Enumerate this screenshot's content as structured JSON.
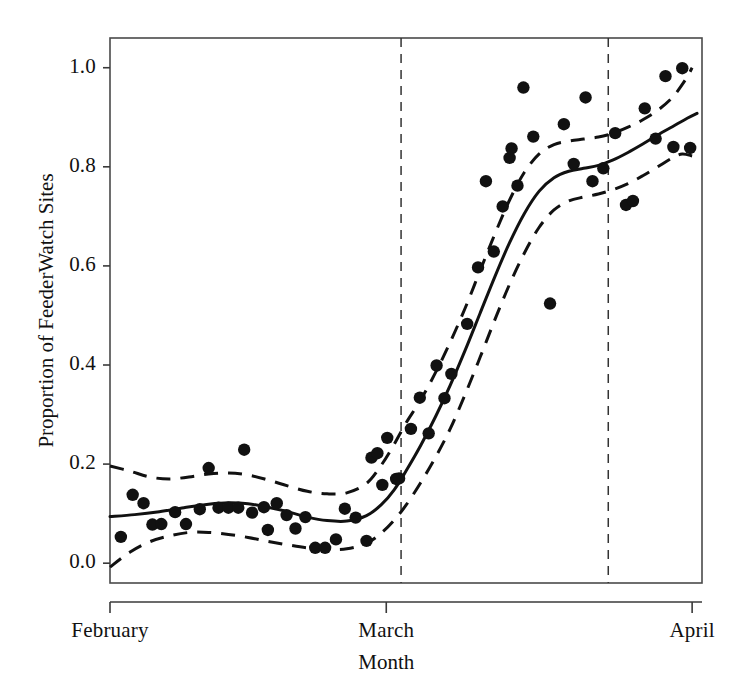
{
  "chart_data": {
    "type": "scatter",
    "title": "",
    "subtitle": "",
    "xlabel": "Month",
    "ylabel": "Proportion of FeederWatch Sites",
    "xlim": [
      0,
      60
    ],
    "ylim": [
      -0.04,
      1.06
    ],
    "grid": false,
    "legend": null,
    "x_tick_values": [
      0,
      28,
      59
    ],
    "x_tick_labels": [
      "February",
      "March",
      "April"
    ],
    "y_tick_values": [
      0.0,
      0.2,
      0.4,
      0.6,
      0.8,
      1.0
    ],
    "y_tick_labels": [
      "0.0",
      "0.2",
      "0.4",
      "0.6",
      "0.8",
      "1.0"
    ],
    "marker_color": "#111111",
    "line_color": "#111111",
    "band_color": "#111111",
    "annotations": [
      {
        "type": "vline",
        "x": 29.5,
        "style": "dashed",
        "label": ""
      },
      {
        "type": "vline",
        "x": 50.5,
        "style": "dashed",
        "label": ""
      }
    ],
    "series": [
      {
        "name": "Observed proportion",
        "style": "points",
        "points": [
          [
            1.1,
            0.053
          ],
          [
            2.3,
            0.138
          ],
          [
            3.4,
            0.121
          ],
          [
            4.3,
            0.078
          ],
          [
            5.2,
            0.079
          ],
          [
            6.6,
            0.103
          ],
          [
            7.7,
            0.079
          ],
          [
            9.1,
            0.109
          ],
          [
            10.0,
            0.192
          ],
          [
            11.0,
            0.112
          ],
          [
            12.0,
            0.112
          ],
          [
            13.0,
            0.112
          ],
          [
            13.6,
            0.229
          ],
          [
            14.4,
            0.102
          ],
          [
            15.6,
            0.113
          ],
          [
            16.0,
            0.067
          ],
          [
            16.9,
            0.121
          ],
          [
            17.9,
            0.097
          ],
          [
            18.8,
            0.07
          ],
          [
            19.8,
            0.093
          ],
          [
            20.8,
            0.031
          ],
          [
            21.8,
            0.031
          ],
          [
            22.9,
            0.048
          ],
          [
            23.8,
            0.11
          ],
          [
            24.9,
            0.092
          ],
          [
            26.0,
            0.045
          ],
          [
            26.5,
            0.213
          ],
          [
            27.1,
            0.222
          ],
          [
            27.6,
            0.158
          ],
          [
            28.1,
            0.253
          ],
          [
            29.0,
            0.17
          ],
          [
            29.3,
            0.171
          ],
          [
            30.5,
            0.271
          ],
          [
            31.4,
            0.334
          ],
          [
            32.3,
            0.262
          ],
          [
            33.1,
            0.399
          ],
          [
            33.9,
            0.333
          ],
          [
            34.6,
            0.382
          ],
          [
            36.2,
            0.483
          ],
          [
            37.3,
            0.597
          ],
          [
            38.1,
            0.771
          ],
          [
            38.9,
            0.629
          ],
          [
            39.8,
            0.72
          ],
          [
            40.5,
            0.818
          ],
          [
            40.7,
            0.837
          ],
          [
            41.3,
            0.762
          ],
          [
            41.9,
            0.96
          ],
          [
            42.9,
            0.861
          ],
          [
            44.6,
            0.524
          ],
          [
            46.0,
            0.886
          ],
          [
            47.0,
            0.806
          ],
          [
            48.2,
            0.94
          ],
          [
            48.9,
            0.771
          ],
          [
            50.0,
            0.797
          ],
          [
            51.2,
            0.868
          ],
          [
            52.3,
            0.723
          ],
          [
            53.0,
            0.731
          ],
          [
            54.2,
            0.918
          ],
          [
            55.3,
            0.857
          ],
          [
            56.3,
            0.983
          ],
          [
            57.1,
            0.84
          ],
          [
            58.0,
            0.999
          ],
          [
            58.8,
            0.838
          ]
        ]
      },
      {
        "name": "Fitted trend",
        "style": "solid-line",
        "points": [
          [
            0.0,
            0.094
          ],
          [
            2.5,
            0.098
          ],
          [
            5.0,
            0.104
          ],
          [
            7.5,
            0.112
          ],
          [
            10.0,
            0.119
          ],
          [
            12.0,
            0.122
          ],
          [
            14.0,
            0.12
          ],
          [
            16.0,
            0.113
          ],
          [
            18.0,
            0.104
          ],
          [
            20.0,
            0.093
          ],
          [
            22.0,
            0.086
          ],
          [
            24.0,
            0.085
          ],
          [
            26.0,
            0.096
          ],
          [
            27.5,
            0.118
          ],
          [
            28.8,
            0.148
          ],
          [
            30.0,
            0.186
          ],
          [
            31.5,
            0.238
          ],
          [
            33.0,
            0.296
          ],
          [
            34.5,
            0.36
          ],
          [
            36.0,
            0.43
          ],
          [
            37.5,
            0.504
          ],
          [
            39.0,
            0.578
          ],
          [
            40.5,
            0.647
          ],
          [
            42.0,
            0.706
          ],
          [
            43.5,
            0.751
          ],
          [
            45.0,
            0.778
          ],
          [
            46.5,
            0.791
          ],
          [
            48.0,
            0.797
          ],
          [
            49.5,
            0.803
          ],
          [
            51.0,
            0.814
          ],
          [
            52.5,
            0.829
          ],
          [
            54.0,
            0.846
          ],
          [
            55.5,
            0.864
          ],
          [
            57.0,
            0.881
          ],
          [
            58.5,
            0.898
          ],
          [
            59.5,
            0.908
          ]
        ]
      },
      {
        "name": "Upper confidence band",
        "style": "dashed-line",
        "points": [
          [
            0.0,
            0.196
          ],
          [
            2.0,
            0.186
          ],
          [
            4.0,
            0.174
          ],
          [
            6.0,
            0.17
          ],
          [
            8.0,
            0.174
          ],
          [
            10.0,
            0.18
          ],
          [
            12.0,
            0.182
          ],
          [
            14.0,
            0.178
          ],
          [
            16.0,
            0.168
          ],
          [
            18.0,
            0.156
          ],
          [
            20.0,
            0.145
          ],
          [
            22.0,
            0.14
          ],
          [
            24.0,
            0.142
          ],
          [
            26.0,
            0.161
          ],
          [
            27.5,
            0.198
          ],
          [
            28.8,
            0.24
          ],
          [
            30.0,
            0.283
          ],
          [
            31.5,
            0.33
          ],
          [
            33.0,
            0.385
          ],
          [
            34.5,
            0.447
          ],
          [
            36.0,
            0.515
          ],
          [
            37.5,
            0.59
          ],
          [
            39.0,
            0.664
          ],
          [
            40.5,
            0.733
          ],
          [
            42.0,
            0.789
          ],
          [
            43.5,
            0.826
          ],
          [
            45.0,
            0.845
          ],
          [
            46.5,
            0.852
          ],
          [
            48.0,
            0.856
          ],
          [
            49.5,
            0.86
          ],
          [
            51.0,
            0.868
          ],
          [
            52.5,
            0.88
          ],
          [
            54.0,
            0.895
          ],
          [
            55.5,
            0.914
          ],
          [
            57.0,
            0.94
          ],
          [
            58.3,
            0.975
          ],
          [
            59.0,
            1.0
          ]
        ]
      },
      {
        "name": "Lower confidence band",
        "style": "dashed-line",
        "points": [
          [
            0.0,
            -0.008
          ],
          [
            2.0,
            0.022
          ],
          [
            4.0,
            0.043
          ],
          [
            6.0,
            0.055
          ],
          [
            8.0,
            0.062
          ],
          [
            10.0,
            0.062
          ],
          [
            12.0,
            0.058
          ],
          [
            14.0,
            0.052
          ],
          [
            16.0,
            0.044
          ],
          [
            18.0,
            0.037
          ],
          [
            20.0,
            0.031
          ],
          [
            22.0,
            0.028
          ],
          [
            24.0,
            0.029
          ],
          [
            26.0,
            0.04
          ],
          [
            27.5,
            0.061
          ],
          [
            28.8,
            0.087
          ],
          [
            30.0,
            0.117
          ],
          [
            31.5,
            0.163
          ],
          [
            33.0,
            0.214
          ],
          [
            34.5,
            0.272
          ],
          [
            36.0,
            0.341
          ],
          [
            37.5,
            0.415
          ],
          [
            39.0,
            0.491
          ],
          [
            40.5,
            0.563
          ],
          [
            42.0,
            0.626
          ],
          [
            43.5,
            0.678
          ],
          [
            45.0,
            0.713
          ],
          [
            46.5,
            0.731
          ],
          [
            48.0,
            0.739
          ],
          [
            49.5,
            0.745
          ],
          [
            51.0,
            0.754
          ],
          [
            52.5,
            0.766
          ],
          [
            54.0,
            0.782
          ],
          [
            55.5,
            0.8
          ],
          [
            57.0,
            0.818
          ],
          [
            58.0,
            0.826
          ],
          [
            59.0,
            0.822
          ]
        ]
      }
    ]
  }
}
